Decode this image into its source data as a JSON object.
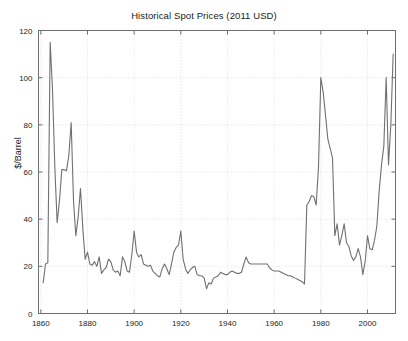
{
  "chart_data": {
    "type": "line",
    "title": "Historical Spot Prices (2011 USD)",
    "xlabel": "",
    "ylabel": "$/Barrel",
    "xlim": [
      1859,
      2012
    ],
    "ylim": [
      0,
      120
    ],
    "xticks": [
      1860,
      1880,
      1900,
      1920,
      1940,
      1960,
      1980,
      2000
    ],
    "yticks": [
      0,
      20,
      40,
      60,
      80,
      100,
      120
    ],
    "xtick_labels": [
      "1860",
      "1880",
      "1900",
      "1920",
      "1940",
      "1960",
      "1980",
      "2000"
    ],
    "ytick_labels": [
      "0",
      "20",
      "40",
      "60",
      "80",
      "100",
      "120"
    ],
    "grid": true,
    "legend": false,
    "line_color": "#707070",
    "series": [
      {
        "name": "Spot price",
        "x": [
          1861,
          1862,
          1863,
          1864,
          1865,
          1866,
          1867,
          1868,
          1869,
          1870,
          1871,
          1872,
          1873,
          1874,
          1875,
          1876,
          1877,
          1878,
          1879,
          1880,
          1881,
          1882,
          1883,
          1884,
          1885,
          1886,
          1887,
          1888,
          1889,
          1890,
          1891,
          1892,
          1893,
          1894,
          1895,
          1896,
          1897,
          1898,
          1899,
          1900,
          1901,
          1902,
          1903,
          1904,
          1905,
          1906,
          1907,
          1908,
          1909,
          1910,
          1911,
          1912,
          1913,
          1914,
          1915,
          1916,
          1917,
          1918,
          1919,
          1920,
          1921,
          1922,
          1923,
          1924,
          1925,
          1926,
          1927,
          1928,
          1929,
          1930,
          1931,
          1932,
          1933,
          1934,
          1935,
          1936,
          1937,
          1938,
          1939,
          1940,
          1941,
          1942,
          1943,
          1944,
          1945,
          1946,
          1947,
          1948,
          1949,
          1950,
          1951,
          1952,
          1953,
          1954,
          1955,
          1956,
          1957,
          1958,
          1959,
          1960,
          1961,
          1962,
          1963,
          1964,
          1965,
          1966,
          1967,
          1968,
          1969,
          1970,
          1971,
          1972,
          1973,
          1974,
          1975,
          1976,
          1977,
          1978,
          1979,
          1980,
          1981,
          1982,
          1983,
          1984,
          1985,
          1986,
          1987,
          1988,
          1989,
          1990,
          1991,
          1992,
          1993,
          1994,
          1995,
          1996,
          1997,
          1998,
          1999,
          2000,
          2001,
          2002,
          2003,
          2004,
          2005,
          2006,
          2007,
          2008,
          2009,
          2010,
          2011
        ],
        "y": [
          13.0,
          21.0,
          21.5,
          115.0,
          95.0,
          62.0,
          38.5,
          48.0,
          61.0,
          61.0,
          60.5,
          67.0,
          81.0,
          48.0,
          33.0,
          41.0,
          53.0,
          36.0,
          23.0,
          26.0,
          21.0,
          20.5,
          22.0,
          20.0,
          24.0,
          17.0,
          18.5,
          19.5,
          23.0,
          22.0,
          18.5,
          17.5,
          18.0,
          16.0,
          24.0,
          22.0,
          18.0,
          17.5,
          25.0,
          35.0,
          26.0,
          24.0,
          25.0,
          21.0,
          20.5,
          20.0,
          20.5,
          18.0,
          17.0,
          16.0,
          15.5,
          19.0,
          21.0,
          19.0,
          16.5,
          21.0,
          26.0,
          28.0,
          29.0,
          35.0,
          23.0,
          19.0,
          17.0,
          18.5,
          19.5,
          20.0,
          16.5,
          16.0,
          16.0,
          15.0,
          10.5,
          13.0,
          12.5,
          15.0,
          15.5,
          16.0,
          17.5,
          17.0,
          16.5,
          16.5,
          17.5,
          18.0,
          17.5,
          17.0,
          17.0,
          17.5,
          21.0,
          24.0,
          21.5,
          21.0,
          21.0,
          21.0,
          21.0,
          21.0,
          21.0,
          21.0,
          21.0,
          19.5,
          18.5,
          18.0,
          18.0,
          18.0,
          17.5,
          17.0,
          16.5,
          16.0,
          16.0,
          15.5,
          15.0,
          14.5,
          14.0,
          13.5,
          12.5,
          46.0,
          47.5,
          50.0,
          49.5,
          46.0,
          62.0,
          100.0,
          94.0,
          84.0,
          74.0,
          70.0,
          66.0,
          33.0,
          38.0,
          29.0,
          33.0,
          38.0,
          30.0,
          28.5,
          24.5,
          22.5,
          24.0,
          27.5,
          24.0,
          16.5,
          22.0,
          33.0,
          27.5,
          27.0,
          31.0,
          37.0,
          52.0,
          63.0,
          71.0,
          100.0,
          63.0,
          80.0,
          110.0
        ]
      }
    ]
  }
}
